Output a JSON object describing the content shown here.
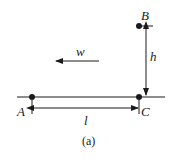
{
  "figure": {
    "caption": "(a)",
    "colors": {
      "stroke": "#1a1a1a",
      "background": "#ffffff"
    }
  },
  "points": {
    "A": {
      "label": "A"
    },
    "B": {
      "label": "B"
    },
    "C": {
      "label": "C"
    }
  },
  "dimensions": {
    "horizontal": {
      "label": "l"
    },
    "vertical": {
      "label": "h"
    }
  },
  "vectors": {
    "wind": {
      "label": "w",
      "direction": "left"
    }
  }
}
